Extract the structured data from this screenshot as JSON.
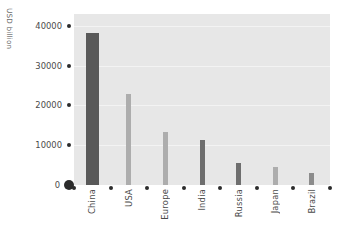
{
  "chart_data": {
    "type": "bar",
    "title": "",
    "subtitle": "",
    "xlabel": "",
    "ylabel": "USD billion",
    "categories": [
      "China",
      "USA",
      "Europe",
      "India",
      "Russia",
      "Japan",
      "Brazil"
    ],
    "values": [
      38300,
      22900,
      13300,
      11300,
      5500,
      4500,
      3000
    ],
    "series": [
      {
        "name": "USD billion",
        "values": [
          38300,
          22900,
          13300,
          11300,
          5500,
          4500,
          3000
        ]
      }
    ],
    "ylim": [
      0,
      43000
    ],
    "yticks": [
      0,
      10000,
      20000,
      30000,
      40000
    ],
    "ytick_labels": [
      "0",
      "10000",
      "20000",
      "30000",
      "40000"
    ],
    "grid": true,
    "legend": "none",
    "bar_colors": [
      "#595959",
      "#adadad",
      "#adadad",
      "#6e6e6e",
      "#6e6e6e",
      "#adadad",
      "#8c8c8c"
    ],
    "plot_background": "#e7e7e7",
    "gridline_color": "#f3f3f3",
    "tick_color": "#2b2b2b",
    "text_color": "#4a4a4a"
  }
}
